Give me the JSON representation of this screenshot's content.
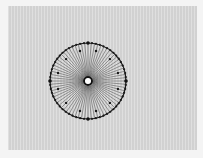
{
  "image": {
    "subject": "spoked-wheel-diagram",
    "background_color": "#d8d8d8",
    "ink_color": "#1a1a1a",
    "wheel": {
      "center_x": 88,
      "center_y": 81,
      "outer_radius": 38,
      "inner_dot_radius": 31,
      "hub_radius": 4,
      "spoke_count": 72,
      "outer_dot_count": 60,
      "inner_dot_count": 12,
      "cardinal_marker_count": 4
    }
  }
}
